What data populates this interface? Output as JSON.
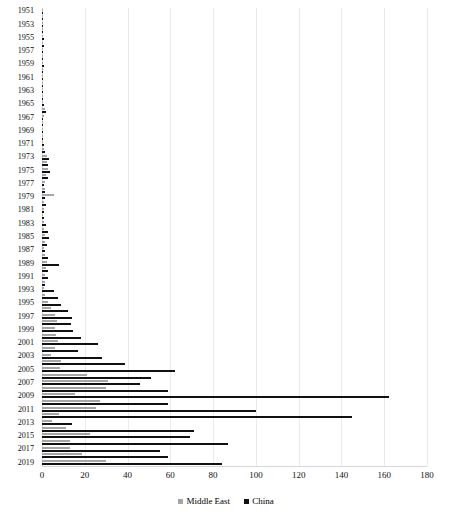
{
  "chart_data": {
    "type": "bar",
    "orientation": "horizontal",
    "title": "",
    "xlabel": "",
    "ylabel": "",
    "xlim": [
      0,
      180
    ],
    "xticks": [
      0,
      20,
      40,
      60,
      80,
      100,
      120,
      140,
      160,
      180
    ],
    "grid": true,
    "legend_position": "bottom-center",
    "categories": [
      "1951",
      "1952",
      "1953",
      "1954",
      "1955",
      "1956",
      "1957",
      "1958",
      "1959",
      "1960",
      "1961",
      "1962",
      "1963",
      "1964",
      "1965",
      "1966",
      "1967",
      "1968",
      "1969",
      "1970",
      "1971",
      "1972",
      "1973",
      "1974",
      "1975",
      "1976",
      "1977",
      "1978",
      "1979",
      "1980",
      "1981",
      "1982",
      "1983",
      "1984",
      "1985",
      "1986",
      "1987",
      "1988",
      "1989",
      "1990",
      "1991",
      "1992",
      "1993",
      "1994",
      "1995",
      "1996",
      "1997",
      "1998",
      "1999",
      "2000",
      "2001",
      "2002",
      "2003",
      "2004",
      "2005",
      "2006",
      "2007",
      "2008",
      "2009",
      "2010",
      "2011",
      "2012",
      "2013",
      "2014",
      "2015",
      "2016",
      "2017",
      "2018",
      "2019"
    ],
    "tick_labels": [
      "1951",
      "1953",
      "1955",
      "1957",
      "1959",
      "1961",
      "1963",
      "1965",
      "1967",
      "1969",
      "1971",
      "1973",
      "1975",
      "1977",
      "1979",
      "1981",
      "1983",
      "1985",
      "1987",
      "1989",
      "1991",
      "1993",
      "1995",
      "1997",
      "1999",
      "2001",
      "2003",
      "2005",
      "2007",
      "2009",
      "2011",
      "2013",
      "2015",
      "2017",
      "2019"
    ],
    "series": [
      {
        "name": "Middle East",
        "color": "#a6a6a6",
        "values": [
          0.4,
          0.3,
          0.5,
          0.4,
          0.6,
          0.5,
          0.7,
          0.6,
          0.5,
          0.6,
          0.4,
          0.3,
          0.2,
          0.3,
          0.5,
          1.2,
          0.8,
          0.4,
          0.3,
          0.4,
          0.6,
          1.0,
          2.4,
          2.2,
          2.6,
          2.0,
          1.4,
          1.2,
          5.6,
          1.0,
          0.8,
          0.7,
          0.9,
          1.1,
          1.6,
          1.3,
          1.0,
          1.5,
          2.2,
          1.8,
          1.4,
          1.2,
          1.0,
          1.6,
          3.0,
          4.2,
          6.0,
          6.8,
          6.2,
          6.6,
          7.4,
          6.0,
          4.0,
          9.0,
          8.4,
          21.0,
          31.0,
          30.0,
          15.6,
          27.0,
          25.2,
          8.0,
          4.6,
          11.0,
          22.4,
          13.0,
          13.2,
          18.8,
          30.0
        ]
      },
      {
        "name": "China",
        "color": "#111111",
        "values": [
          0.5,
          0.3,
          0.6,
          0.4,
          0.8,
          0.9,
          0.7,
          0.6,
          0.8,
          0.7,
          0.3,
          0.2,
          0.2,
          0.6,
          1.0,
          2.0,
          0.6,
          0.3,
          0.3,
          0.5,
          0.8,
          1.4,
          3.4,
          2.8,
          3.6,
          3.0,
          1.0,
          1.2,
          1.6,
          1.8,
          1.0,
          0.9,
          2.0,
          2.6,
          3.2,
          2.2,
          1.4,
          3.0,
          7.8,
          2.6,
          3.0,
          1.6,
          5.4,
          7.6,
          9.0,
          12.0,
          14.2,
          13.6,
          14.4,
          18.0,
          26.0,
          17.0,
          28.0,
          39.0,
          62.0,
          51.0,
          46.0,
          59.0,
          162.0,
          59.0,
          100.0,
          145.0,
          14.0,
          71.0,
          69.0,
          87.0,
          55.0,
          59.0,
          84.0
        ]
      }
    ]
  },
  "legend": {
    "items": [
      {
        "label": "Middle East",
        "color": "#a6a6a6"
      },
      {
        "label": "China",
        "color": "#111111"
      }
    ]
  }
}
